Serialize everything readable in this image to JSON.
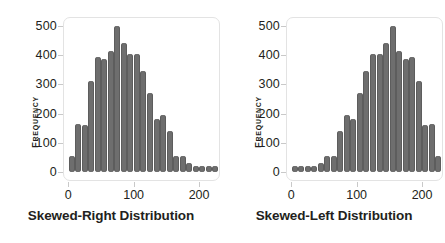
{
  "figure": {
    "background": "#ffffff",
    "bar_color": "#6e6e6e",
    "frame_color": "#e3e3e3",
    "tick_color": "#c9c9c9",
    "text_color": "#231f20"
  },
  "axis": {
    "y_title": "Frequency",
    "y_ticks": [
      "500",
      "400",
      "300",
      "200",
      "100",
      "0"
    ],
    "x_ticks": [
      "0",
      "100",
      "200"
    ]
  },
  "chart_data": [
    {
      "type": "bar",
      "title": "",
      "xlabel": "Skewed-Right Distribution",
      "ylabel": "Frequency",
      "xlim": [
        -8,
        232
      ],
      "ylim": [
        0,
        520
      ],
      "xtick_values": [
        0,
        100,
        200
      ],
      "xtick_labels": [
        "0",
        "100",
        "200"
      ],
      "ytick_values": [
        0,
        100,
        200,
        300,
        400,
        500
      ],
      "ytick_labels": [
        "0",
        "100",
        "200",
        "300",
        "400",
        "500"
      ],
      "grid": false,
      "legend": "none",
      "bin_width": 10,
      "x": [
        5,
        15,
        25,
        35,
        45,
        55,
        65,
        75,
        85,
        95,
        105,
        115,
        125,
        135,
        145,
        155,
        165,
        175,
        185,
        195,
        205,
        215,
        225
      ],
      "values": [
        55,
        165,
        160,
        310,
        395,
        385,
        415,
        500,
        440,
        405,
        405,
        345,
        270,
        180,
        195,
        140,
        55,
        55,
        30,
        8,
        8,
        8,
        8
      ]
    },
    {
      "type": "bar",
      "title": "",
      "xlabel": "Skewed-Left Distribution",
      "ylabel": "Frequency",
      "xlim": [
        -8,
        232
      ],
      "ylim": [
        0,
        520
      ],
      "xtick_values": [
        0,
        100,
        200
      ],
      "xtick_labels": [
        "0",
        "100",
        "200"
      ],
      "ytick_values": [
        0,
        100,
        200,
        300,
        400,
        500
      ],
      "ytick_labels": [
        "0",
        "100",
        "200",
        "300",
        "400",
        "500"
      ],
      "grid": false,
      "legend": "none",
      "bin_width": 10,
      "x": [
        5,
        15,
        25,
        35,
        45,
        55,
        65,
        75,
        85,
        95,
        105,
        115,
        125,
        135,
        145,
        155,
        165,
        175,
        185,
        195,
        205,
        215,
        225
      ],
      "values": [
        8,
        8,
        8,
        8,
        30,
        55,
        55,
        140,
        195,
        180,
        270,
        345,
        405,
        405,
        440,
        500,
        415,
        385,
        395,
        310,
        160,
        165,
        55
      ]
    }
  ]
}
